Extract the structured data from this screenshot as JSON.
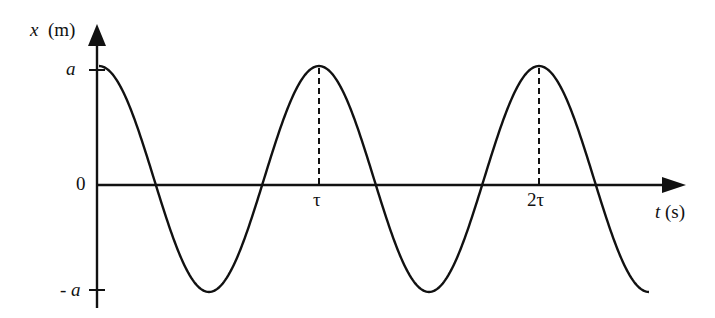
{
  "chart_data": {
    "type": "line",
    "title": "",
    "function": "x(t) = a cos(2πt/τ)",
    "xlabel": "t (s)",
    "xlabel_var": "t",
    "xlabel_unit": "(s)",
    "ylabel": "x (m)",
    "ylabel_var": "x",
    "ylabel_unit": "(m)",
    "x_ticks": [
      {
        "value": 1,
        "label": "τ"
      },
      {
        "value": 2,
        "label": "2τ"
      }
    ],
    "y_ticks": [
      {
        "value": 1,
        "label": "a"
      },
      {
        "value": 0,
        "label": "0"
      },
      {
        "value": -1,
        "label": "- a"
      }
    ],
    "xlim": [
      0,
      2.5
    ],
    "ylim": [
      -1,
      1
    ],
    "grid": false,
    "legend": null,
    "series": [
      {
        "name": "x(t)",
        "x": [
          0,
          0.25,
          0.5,
          0.75,
          1.0,
          1.25,
          1.5,
          1.75,
          2.0,
          2.25,
          2.5
        ],
        "values": [
          1,
          0,
          -1,
          0,
          1,
          0,
          -1,
          0,
          1,
          0,
          -1
        ]
      }
    ],
    "annotations": [
      {
        "type": "dashed-vertical-line",
        "x": 1,
        "from": 0,
        "to": 1
      },
      {
        "type": "dashed-vertical-line",
        "x": 2,
        "from": 0,
        "to": 1
      }
    ]
  },
  "labels": {
    "y_var": "x",
    "y_unit": "(m)",
    "x_var": "t",
    "x_unit": "(s)",
    "tick_a": "a",
    "tick_zero": "0",
    "tick_neg_a_sign": "-",
    "tick_neg_a": "a",
    "tick_tau": "τ",
    "tick_2tau": "2τ"
  }
}
